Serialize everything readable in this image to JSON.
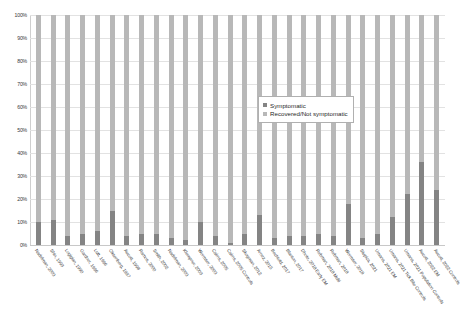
{
  "chart_data": {
    "type": "bar",
    "title": "",
    "xlabel": "",
    "ylabel": "",
    "ylim": [
      0,
      100
    ],
    "ytick_labels": [
      "100%",
      "90%",
      "80%",
      "70%",
      "60%",
      "50%",
      "40%",
      "30%",
      "20%",
      "10%",
      "0%"
    ],
    "ytick_values": [
      100,
      90,
      80,
      70,
      60,
      50,
      40,
      30,
      20,
      10,
      0
    ],
    "grid": true,
    "stacked": true,
    "stack_total": 100,
    "legend_position": "inside-right-upper",
    "categories": [
      "Nadelman, 2003",
      "Shin, 1993",
      "Logigian, 1990",
      "Gardner, 1996",
      "Luft, 1996",
      "Oksenberg, 1997",
      "Aucott, 1998",
      "Ramos, 2000",
      "Smith, 2002",
      "Nadelman, 2003",
      "Klempner, 2003",
      "Wormser, 2003",
      "Cairns, 2005",
      "Cairns, 2005 Controls",
      "Skogman, 2012",
      "Arnez, 2015",
      "Bechtold, 2017",
      "Blanton, 2017",
      "Dhote, 2018 Early EM",
      "Rebman, 2018 Multi",
      "Rebman, 2018",
      "Wormser, 2018",
      "Stupica, 2021",
      "Umana, 2021 EM",
      "Umana, 2021 Tick Bite Controls",
      "Umana, 2021 Population Controls",
      "Aucott, 2022 EM",
      "Aucott, 2022 Controls"
    ],
    "series": [
      {
        "name": "Symptomatic",
        "color": "#848484",
        "values": [
          10,
          11,
          4,
          5,
          6,
          15,
          4,
          5,
          5,
          3,
          2,
          10,
          4,
          1,
          5,
          13,
          3,
          4,
          4,
          5,
          4,
          18,
          3,
          5,
          12,
          22,
          36,
          24
        ]
      },
      {
        "name": "Recovered/Not symptomatic",
        "color": "#b8b8b8",
        "values": [
          90,
          89,
          96,
          95,
          94,
          85,
          96,
          95,
          95,
          97,
          98,
          90,
          96,
          99,
          95,
          87,
          97,
          96,
          96,
          95,
          96,
          82,
          97,
          95,
          88,
          78,
          64,
          76
        ]
      }
    ],
    "legend": [
      {
        "label": "Symptomatic",
        "color": "#848484"
      },
      {
        "label": "Recovered/Not symptomatic",
        "color": "#b8b8b8"
      }
    ]
  }
}
